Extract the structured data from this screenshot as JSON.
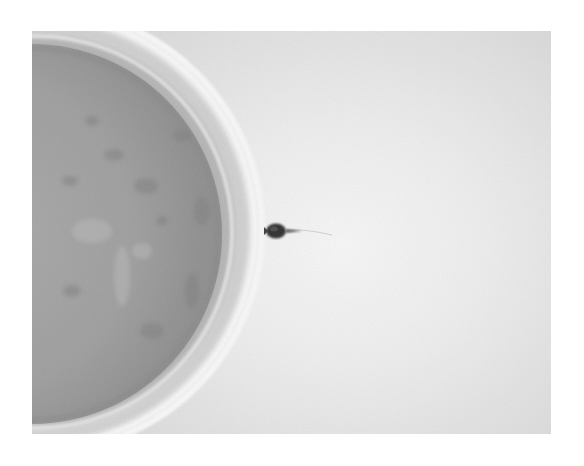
{
  "image": {
    "subject": "Micrograph of a sperm cell contacting the outer membrane of an egg cell (oocyte)",
    "elements": [
      {
        "name": "egg-cell",
        "description": "Large round oocyte partially cropped on the left, grey granular cytoplasm surrounded by a bright translucent zona pellucida ring"
      },
      {
        "name": "sperm-cell",
        "description": "Small dark sperm head touching the right edge of the egg, with a faint thin tail extending to the right"
      }
    ],
    "colors": {
      "page_background": "#ffffff",
      "field_center": "#f6f6f6",
      "field_edge": "#cdcdcd",
      "cytoplasm": "#9e9e9e",
      "zona_ring": "#f2f2f2",
      "sperm_head": "#2e2e2e"
    }
  }
}
